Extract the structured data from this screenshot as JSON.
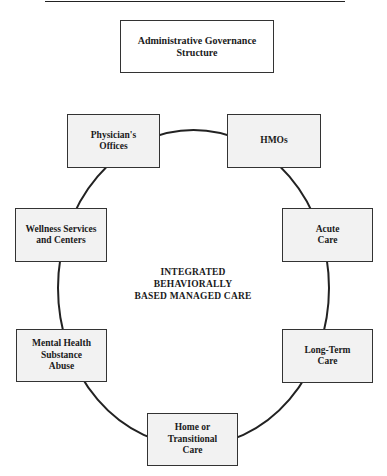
{
  "diagram": {
    "title_box": {
      "label": "Administrative Governance\nStructure"
    },
    "center_label": "INTEGRATED\nBEHAVIORALLY\nBASED MANAGED CARE",
    "nodes": [
      {
        "id": "physicians-offices",
        "label": "Physician's\nOffices"
      },
      {
        "id": "hmos",
        "label": "HMOs"
      },
      {
        "id": "acute-care",
        "label": "Acute\nCare"
      },
      {
        "id": "long-term-care",
        "label": "Long-Term\nCare"
      },
      {
        "id": "home-transitional-care",
        "label": "Home or\nTransitional\nCare"
      },
      {
        "id": "mental-health-substance-abuse",
        "label": "Mental Health\nSubstance\nAbuse"
      },
      {
        "id": "wellness-services-centers",
        "label": "Wellness Services\nand Centers"
      }
    ],
    "connector": "ellipse linking all nodes in a ring"
  }
}
